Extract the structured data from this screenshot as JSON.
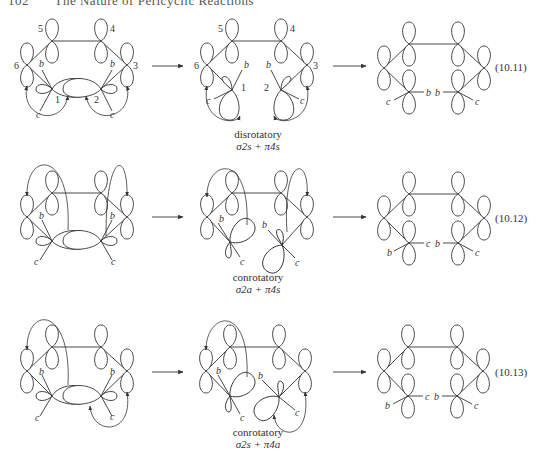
{
  "page_header": {
    "page_number": "102",
    "running_title": "The Nature of Pericyclic Reactions"
  },
  "rows": [
    {
      "equation_number": "(10.11)",
      "mode": "disrotatory",
      "components": "σ2s + π4s",
      "atom_labels": [
        "1",
        "2",
        "3",
        "4",
        "5",
        "6"
      ],
      "substituent_labels": [
        "b",
        "c"
      ]
    },
    {
      "equation_number": "(10.12)",
      "mode": "conrotatory",
      "components": "σ2a + π4s",
      "substituent_labels": [
        "b",
        "c"
      ]
    },
    {
      "equation_number": "(10.13)",
      "mode": "conrotatory",
      "components": "σ2s + π4a",
      "substituent_labels": [
        "b",
        "c"
      ]
    }
  ],
  "colors": {
    "ink": "#333333",
    "background": "#ffffff"
  }
}
